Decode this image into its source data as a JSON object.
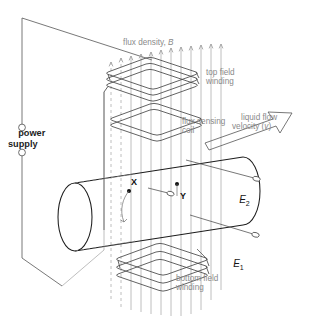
{
  "figure": {
    "type": "technical-diagram",
    "background_color": "#ffffff",
    "line_color": "#4a4a4a",
    "label_color": "#8a8a8a",
    "dark_label_color": "#1c1c1c"
  },
  "labels": {
    "power_supply": "power\nsupply",
    "flux_density": "flux density, ",
    "flux_density_symbol": "B",
    "top_field_winding": "top field\nwinding",
    "flux_sensing_coil": "flux sensing\ncoil",
    "liquid_flow_velocity": "liquid flow\nvelocity (",
    "liquid_flow_velocity_symbol": "v",
    "liquid_flow_velocity_close": ")",
    "bottom_field_winding": "bottom field\nwinding",
    "point_x": "X",
    "point_y": "Y",
    "electrode_1": "E",
    "electrode_1_sub": "1",
    "electrode_2": "E",
    "electrode_2_sub": "2"
  },
  "components": {
    "power_supply_terminals": 2,
    "top_field_winding_turns": 3,
    "bottom_field_winding_turns": 3,
    "flux_sensing_coil_turns": 2,
    "flux_arrows": 12,
    "flux_field_lines": 12,
    "electrodes": 2,
    "measurement_points": [
      "X",
      "Y"
    ]
  }
}
